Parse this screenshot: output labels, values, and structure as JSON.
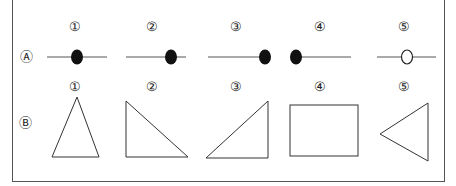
{
  "row_a": {
    "label": "Ⓐ",
    "items": [
      {
        "num": "①",
        "dot": "filled",
        "dot_position": "center"
      },
      {
        "num": "②",
        "dot": "filled",
        "dot_position": "right-of-center"
      },
      {
        "num": "③",
        "dot": "filled",
        "dot_position": "right-end"
      },
      {
        "num": "④",
        "dot": "filled",
        "dot_position": "left-end"
      },
      {
        "num": "⑤",
        "dot": "hollow",
        "dot_position": "center"
      }
    ]
  },
  "row_b": {
    "label": "Ⓑ",
    "items": [
      {
        "num": "①",
        "shape": "isosceles-triangle"
      },
      {
        "num": "②",
        "shape": "right-triangle-left"
      },
      {
        "num": "③",
        "shape": "right-triangle-right"
      },
      {
        "num": "④",
        "shape": "rectangle"
      },
      {
        "num": "⑤",
        "shape": "triangle-pointing-left"
      }
    ]
  },
  "colors": {
    "stroke": "#333333",
    "dot": "#111111"
  }
}
